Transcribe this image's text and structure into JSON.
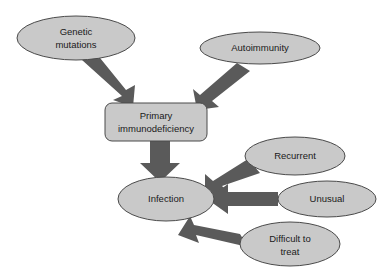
{
  "diagram": {
    "colors": {
      "node_fill": "#c9c9c9",
      "node_stroke": "#555555",
      "arrow_fill": "#5a5a5a",
      "text": "#1a1a1a",
      "background": "#ffffff"
    },
    "nodes": [
      {
        "id": "genetic-mutations",
        "shape": "ellipse",
        "lines": [
          "Genetic",
          "mutations"
        ],
        "cx": 76,
        "cy": 38,
        "rx": 59,
        "ry": 22
      },
      {
        "id": "autoimmunity",
        "shape": "ellipse",
        "lines": [
          "Autoimmunity"
        ],
        "cx": 260,
        "cy": 48,
        "rx": 60,
        "ry": 16
      },
      {
        "id": "primary-immunodeficiency",
        "shape": "rounded-rect",
        "lines": [
          "Primary",
          "immunodeficiency"
        ],
        "x": 105,
        "y": 103,
        "width": 102,
        "height": 38,
        "radius": 7
      },
      {
        "id": "infection",
        "shape": "ellipse",
        "lines": [
          "Infection"
        ],
        "cx": 166,
        "cy": 199,
        "rx": 48,
        "ry": 22
      },
      {
        "id": "recurrent",
        "shape": "ellipse",
        "lines": [
          "Recurrent"
        ],
        "cx": 295,
        "cy": 156,
        "rx": 50,
        "ry": 19
      },
      {
        "id": "unusual",
        "shape": "ellipse",
        "lines": [
          "Unusual"
        ],
        "cx": 327,
        "cy": 199,
        "rx": 49,
        "ry": 18
      },
      {
        "id": "difficult-to-treat",
        "shape": "ellipse",
        "lines": [
          "Difficult to",
          "treat"
        ],
        "cx": 290,
        "cy": 244,
        "rx": 50,
        "ry": 22
      }
    ],
    "arrows": [
      {
        "id": "genetic-to-pid",
        "from": "genetic-mutations",
        "to": "primary-immunodeficiency",
        "direction": "down-right"
      },
      {
        "id": "autoimmunity-to-pid",
        "from": "autoimmunity",
        "to": "primary-immunodeficiency",
        "direction": "down-left"
      },
      {
        "id": "pid-to-infection",
        "from": "primary-immunodeficiency",
        "to": "infection",
        "direction": "down"
      },
      {
        "id": "recurrent-to-infection",
        "from": "recurrent",
        "to": "infection",
        "direction": "down-left"
      },
      {
        "id": "unusual-to-infection",
        "from": "unusual",
        "to": "infection",
        "direction": "left"
      },
      {
        "id": "difficult-to-infection",
        "from": "difficult-to-treat",
        "to": "infection",
        "direction": "up-left"
      }
    ]
  }
}
